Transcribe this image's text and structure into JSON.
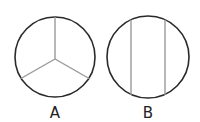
{
  "figures": [
    {
      "label": "A",
      "description": "circle divided into three equal sectors",
      "divisions": 3
    },
    {
      "label": "B",
      "description": "circle divided by two vertical chords into three parts",
      "divisions": 3
    }
  ],
  "colors": {
    "outline": "#2a2a2a",
    "divider": "#9a9a9a"
  }
}
